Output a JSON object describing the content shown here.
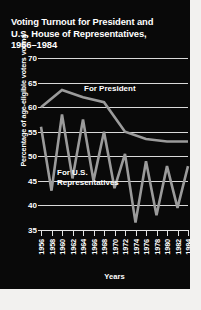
{
  "figure": {
    "background": "#090909",
    "foreground": "#ffffff",
    "grid_color": "#d9d9d9",
    "line_color": "#9b9b9b"
  },
  "title": {
    "line1": "Voting Turnout for President and",
    "line2": "U.S. House of Representatives,",
    "line3": "1956–1984"
  },
  "chart_data": {
    "type": "line",
    "title": "Voting Turnout for President and U.S. House of Representatives, 1956–1984",
    "xlabel": "Years",
    "ylabel": "Percentage of age-eligible voters voting",
    "xlim": [
      1956,
      1984
    ],
    "ylim": [
      35,
      70
    ],
    "yticks": [
      35,
      40,
      45,
      50,
      55,
      60,
      65,
      70
    ],
    "grid": true,
    "legend": "inline-annotations",
    "categories": [
      1956,
      1958,
      1960,
      1962,
      1964,
      1966,
      1968,
      1970,
      1972,
      1974,
      1976,
      1978,
      1980,
      1982,
      1984
    ],
    "x": [
      "1956",
      "1958",
      "1960",
      "1962",
      "1964",
      "1966",
      "1968",
      "1970",
      "1972",
      "1974",
      "1976",
      "1978",
      "1980",
      "1982",
      "1984"
    ],
    "series": [
      {
        "name": "For President",
        "label": "For President",
        "x": [
          1956,
          1960,
          1964,
          1968,
          1972,
          1976,
          1980,
          1984
        ],
        "values": [
          60.0,
          63.5,
          62.0,
          61.0,
          55.0,
          53.5,
          53.0,
          53.0
        ]
      },
      {
        "name": "For U.S. Representatives",
        "label_line1": "For U.S.",
        "label_line2": "Representatives",
        "x": [
          1956,
          1958,
          1960,
          1962,
          1964,
          1966,
          1968,
          1970,
          1972,
          1974,
          1976,
          1978,
          1980,
          1982,
          1984
        ],
        "values": [
          56.0,
          43.0,
          58.5,
          45.5,
          57.5,
          45.0,
          55.0,
          43.5,
          50.5,
          36.5,
          49.0,
          38.0,
          48.0,
          39.5,
          48.0
        ]
      }
    ]
  },
  "annotations": {
    "president_label": "For President",
    "house_label_line1": "For U.S.",
    "house_label_line2": "Representatives"
  },
  "axis": {
    "x_title": "Years",
    "y_title": "Percentage of age-eligible voters voting"
  }
}
